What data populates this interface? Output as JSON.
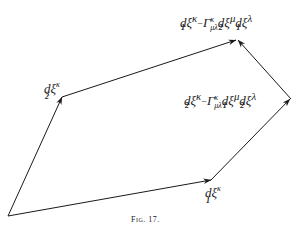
{
  "figure": {
    "caption": "Fig. 17.",
    "stroke_color": "#1a1a1a",
    "vertices": {
      "origin": [
        8,
        216
      ],
      "after_d2": [
        62,
        97
      ],
      "top": [
        237,
        39
      ],
      "right": [
        291,
        99
      ],
      "after_d1": [
        211,
        180
      ]
    },
    "edges": [
      {
        "from": "origin",
        "to": "after_d2",
        "label": "dξ^κ with lower index 2"
      },
      {
        "from": "after_d2",
        "to": "top",
        "label": "dξ^κ index 1 − Γ^κ_μλ dξ^μ index 2 dξ^λ index 1"
      },
      {
        "from": "origin",
        "to": "after_d1",
        "label": "dξ^κ with lower index 1"
      },
      {
        "from": "after_d1",
        "to": "right",
        "label": "dξ^κ index 2 − Γ^κ_μλ dξ^μ index 1 dξ^λ index 2"
      },
      {
        "from": "right",
        "to": "top",
        "label": ""
      }
    ]
  },
  "labels": {
    "d2": {
      "d": "d",
      "xi": "ξ",
      "sup": "κ",
      "idx": "2"
    },
    "d1": {
      "d": "d",
      "xi": "ξ",
      "sup": "κ",
      "idx": "1"
    },
    "top": {
      "t1": {
        "d": "d",
        "xi": "ξ",
        "sup": "κ",
        "idx": "1"
      },
      "minus": "−",
      "gamma": "Γ",
      "gamma_sup": "κ",
      "gamma_sub": "μλ",
      "t2": {
        "d": "d",
        "xi": "ξ",
        "sup": "μ",
        "idx": "2"
      },
      "t3": {
        "d": "d",
        "xi": "ξ",
        "sup": "λ",
        "idx": "1"
      }
    },
    "right": {
      "t1": {
        "d": "d",
        "xi": "ξ",
        "sup": "κ",
        "idx": "2"
      },
      "minus": "−",
      "gamma": "Γ",
      "gamma_sup": "κ",
      "gamma_sub": "μλ",
      "t2": {
        "d": "d",
        "xi": "ξ",
        "sup": "μ",
        "idx": "1"
      },
      "t3": {
        "d": "d",
        "xi": "ξ",
        "sup": "λ",
        "idx": "2"
      }
    }
  }
}
